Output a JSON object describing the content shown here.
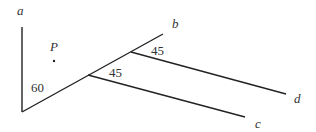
{
  "diagram": {
    "labels": {
      "a": "a",
      "b": "b",
      "c": "c",
      "d": "d",
      "point": "P"
    },
    "angles": {
      "angle_ab": "60",
      "angle_lower_branch": "45",
      "angle_upper_branch": "45"
    },
    "colors": {
      "stroke": "#222222",
      "text": "#333333",
      "background": "#ffffff"
    }
  }
}
